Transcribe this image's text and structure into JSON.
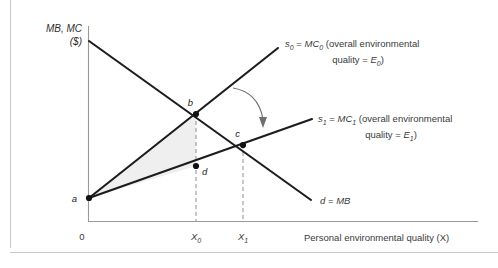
{
  "figure": {
    "y_axis_title_line1": "MB, MC",
    "y_axis_title_line2": "($)",
    "x_axis_title": "Personal environmental quality (X)",
    "origin_label": "0",
    "ticks": [
      {
        "name": "x0",
        "label_main": "X",
        "label_sub": "0"
      },
      {
        "name": "x1",
        "label_main": "X",
        "label_sub": "1"
      }
    ],
    "points": [
      {
        "name": "a",
        "label": "a"
      },
      {
        "name": "b",
        "label": "b"
      },
      {
        "name": "c",
        "label": "c"
      },
      {
        "name": "d",
        "label": "d"
      }
    ],
    "curves": [
      {
        "name": "supply-0",
        "label_var": "s",
        "label_var_sub": "0",
        "label_eq": "= ",
        "label_mc": "MC",
        "label_mc_sub": "0",
        "label_line1_tail": " (overall environmental",
        "label_line2_prefix": "quality = ",
        "label_line2_var": "E",
        "label_line2_sub": "0",
        "label_line2_tail": ")"
      },
      {
        "name": "supply-1",
        "label_var": "s",
        "label_var_sub": "1",
        "label_eq": "= ",
        "label_mc": "MC",
        "label_mc_sub": "1",
        "label_line1_tail": " (overall environmental",
        "label_line2_prefix": "quality = ",
        "label_line2_var": "E",
        "label_line2_sub": "1",
        "label_line2_tail": ")"
      },
      {
        "name": "demand",
        "label_var": "d",
        "label_eq": "= ",
        "label_mb": "MB"
      }
    ],
    "annotations": {
      "shift_arrow_name": "supply-shift-arrow",
      "shaded_region_name": "welfare-gain-triangle-abd"
    },
    "colors": {
      "curve": "#1c1c1c",
      "axis": "#9a9a9a",
      "dashed_guide": "#9a9a9a",
      "shaded_region": "#efefef",
      "text": "#3b3b3b",
      "frame": "#c9c9c9",
      "background": "#ffffff"
    }
  }
}
